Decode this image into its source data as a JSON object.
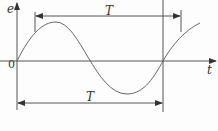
{
  "diagram": {
    "y_axis_label": "e",
    "x_axis_label": "t",
    "origin_label": "0",
    "period_label_top": "T",
    "period_label_bottom": "T",
    "curve": "sine wave",
    "stroke_color": "#555555"
  }
}
